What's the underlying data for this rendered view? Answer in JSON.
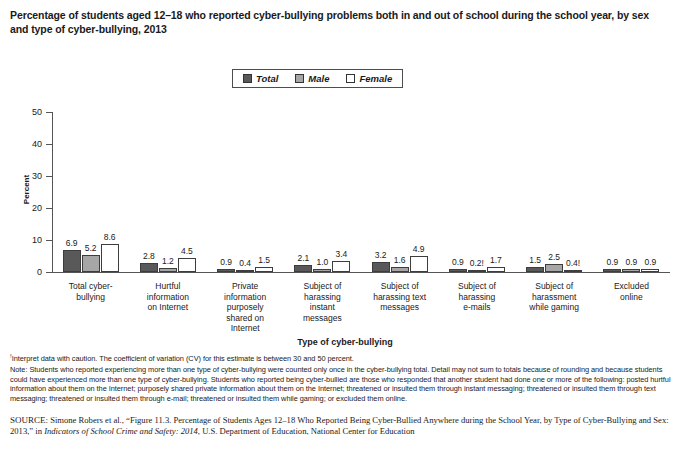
{
  "title": "Percentage of students aged 12–18 who reported cyber-bullying problems both in and out of school during the school year, by sex and type of cyber-bullying, 2013",
  "legend": {
    "items": [
      {
        "label": "Total",
        "color": "#595959"
      },
      {
        "label": "Male",
        "color": "#a6a6a6"
      },
      {
        "label": "Female",
        "color": "#ffffff"
      }
    ]
  },
  "axes": {
    "ylabel": "Percent",
    "xlabel": "Type of cyber-bullying",
    "yticks": [
      "0",
      "10",
      "20",
      "30",
      "40",
      "50"
    ]
  },
  "notes": {
    "footnote_marker": "!",
    "footnote": "Interpret data with caution. The coefficient of variation (CV) for this estimate is between 30 and 50 percent.",
    "note": "Note: Students who reported experiencing more than one type of cyber-bullying were counted only once in the cyber-bullying total. Detail may not sum to totals because of rounding and because students could have experienced more than one type of cyber-bullying. Students who reported being cyber-bullied are those who responded that another student had done one or more of the following: posted hurtful information about them on the Internet; purposely shared private information about them on the Internet; threatened or insulted them through instant messaging; threatened or insulted them through text messaging; threatened or insulted them through e-mail; threatened or insulted them while gaming; or excluded them online.",
    "source_label": "SOURCE:",
    "source_part1": " Simone Robers et al., “Figure 11.3. Percentage of Students Ages 12–18 Who Reported Being Cyber-Bullied Anywhere during the School Year, by Type of Cyber-Bullying and Sex: 2013,” in ",
    "source_italic": "Indicators of School Crime and Safety: 2014",
    "source_part2": ", U.S. Department of Education, National Center for Education"
  },
  "chart_data": {
    "type": "bar",
    "title": "Percentage of students aged 12–18 who reported cyber-bullying problems both in and out of school during the school year, by sex and type of cyber-bullying, 2013",
    "xlabel": "Type of cyber-bullying",
    "ylabel": "Percent",
    "ylim": [
      0,
      50
    ],
    "ytick_values": [
      0,
      10,
      20,
      30,
      40,
      50
    ],
    "grid": false,
    "legend_position": "top-center",
    "categories": [
      "Total cyber-bullying",
      "Hurtful information on Internet",
      "Private information purposely shared on Internet",
      "Subject of harassing instant messages",
      "Subject of harassing text messages",
      "Subject of harassing e-mails",
      "Subject of harassment while gaming",
      "Excluded online"
    ],
    "category_lines": [
      [
        "Total cyber-",
        "bullying"
      ],
      [
        "Hurtful",
        "information",
        "on Internet"
      ],
      [
        "Private",
        "information",
        "purposely",
        "shared on",
        "Internet"
      ],
      [
        "Subject of",
        "harassing",
        "instant",
        "messages"
      ],
      [
        "Subject of",
        "harassing text",
        "messages"
      ],
      [
        "Subject of",
        "harassing",
        "e-mails"
      ],
      [
        "Subject of",
        "harassment",
        "while gaming"
      ],
      [
        "Excluded",
        "online"
      ]
    ],
    "series": [
      {
        "name": "Total",
        "values": [
          6.9,
          2.8,
          0.9,
          2.1,
          3.2,
          0.9,
          1.5,
          0.9
        ],
        "labels": [
          "6.9",
          "2.8",
          "0.9",
          "2.1",
          "3.2",
          "0.9",
          "1.5",
          "0.9"
        ]
      },
      {
        "name": "Male",
        "values": [
          5.2,
          1.2,
          0.4,
          1.0,
          1.6,
          0.2,
          2.5,
          0.9
        ],
        "labels": [
          "5.2",
          "1.2",
          "0.4",
          "1.0",
          "1.6",
          "0.2!",
          "2.5",
          "0.9"
        ]
      },
      {
        "name": "Female",
        "values": [
          8.6,
          4.5,
          1.5,
          3.4,
          4.9,
          1.7,
          0.4,
          0.9
        ],
        "labels": [
          "8.6",
          "4.5",
          "1.5",
          "3.4",
          "4.9",
          "1.7",
          "0.4!",
          "0.9"
        ]
      }
    ]
  }
}
